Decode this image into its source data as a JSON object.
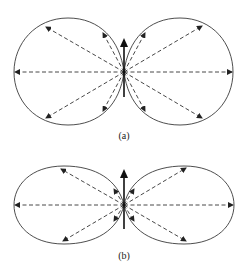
{
  "figure": {
    "panels": [
      {
        "id": "a",
        "label": "(a)",
        "lobe_shape": "circular (sin-theta pattern)"
      },
      {
        "id": "b",
        "label": "(b)",
        "lobe_shape": "elongated (sin-squared-theta pattern)"
      }
    ],
    "elements": {
      "dipole_arrow": "vertical solid arrow at origin pointing up",
      "rays": "dashed arrows radiating from origin to lobe boundary",
      "line_color": "#333333",
      "background": "#ffffff"
    }
  }
}
